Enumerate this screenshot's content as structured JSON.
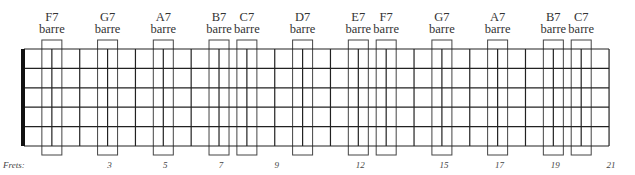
{
  "diagram": {
    "type": "guitar-fretboard-barre-chart",
    "strings": 6,
    "frets_total": 21,
    "nut_x": 24,
    "fret_spacing": 27.86,
    "string_top_y": 49,
    "string_spacing": 19.4,
    "line_color": "#222222",
    "nut_color": "#111111"
  },
  "chords": [
    {
      "name": "F7",
      "sub": "barre",
      "fret": 1
    },
    {
      "name": "G7",
      "sub": "barre",
      "fret": 3
    },
    {
      "name": "A7",
      "sub": "barre",
      "fret": 5
    },
    {
      "name": "B7",
      "sub": "barre",
      "fret": 7
    },
    {
      "name": "C7",
      "sub": "barre",
      "fret": 8
    },
    {
      "name": "D7",
      "sub": "barre",
      "fret": 10
    },
    {
      "name": "E7",
      "sub": "barre",
      "fret": 12
    },
    {
      "name": "F7",
      "sub": "barre",
      "fret": 13
    },
    {
      "name": "G7",
      "sub": "barre",
      "fret": 15
    },
    {
      "name": "A7",
      "sub": "barre",
      "fret": 17
    },
    {
      "name": "B7",
      "sub": "barre",
      "fret": 19
    },
    {
      "name": "C7",
      "sub": "barre",
      "fret": 20
    }
  ],
  "fret_markers": {
    "title": "Frets:",
    "numbers": [
      {
        "label": "3",
        "fret": 3
      },
      {
        "label": "5",
        "fret": 5
      },
      {
        "label": "7",
        "fret": 7
      },
      {
        "label": "9",
        "fret": 9
      },
      {
        "label": "12",
        "fret": 12
      },
      {
        "label": "15",
        "fret": 15
      },
      {
        "label": "17",
        "fret": 17
      },
      {
        "label": "19",
        "fret": 19
      },
      {
        "label": "21",
        "fret": 21
      }
    ]
  }
}
